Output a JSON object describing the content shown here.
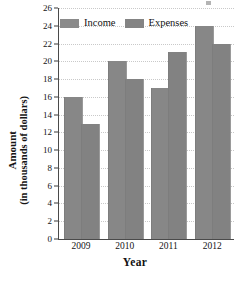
{
  "chart_data": {
    "type": "bar",
    "title": "",
    "categories": [
      "2009",
      "2010",
      "2011",
      "2012"
    ],
    "series": [
      {
        "name": "Income",
        "values": [
          16,
          20,
          17,
          24
        ]
      },
      {
        "name": "Expenses",
        "values": [
          13,
          18,
          21,
          22
        ]
      }
    ],
    "xlabel": "Year",
    "ylabel": "Amount",
    "ylabel_sub": "(in thousands of dollars)",
    "ylim": [
      0,
      26
    ],
    "ytick_step": 2,
    "yticks": [
      0,
      2,
      4,
      6,
      8,
      10,
      12,
      14,
      16,
      18,
      20,
      22,
      24,
      26
    ],
    "ytick_labels": [
      "0",
      "2",
      "4",
      "6",
      "8",
      "10",
      "12",
      "14",
      "16",
      "18",
      "20",
      "22",
      "24",
      "26"
    ],
    "grid": true,
    "grid_axis": "y",
    "legend_position": "top-center",
    "legend": [
      "Income",
      "Expenses"
    ]
  },
  "colors": {
    "income_bar": "#878787",
    "expenses_bar": "#828282",
    "axis": "#4a4a4a",
    "gridline": "#c9c9c9",
    "text": "#141414",
    "background": "#ffffff"
  }
}
